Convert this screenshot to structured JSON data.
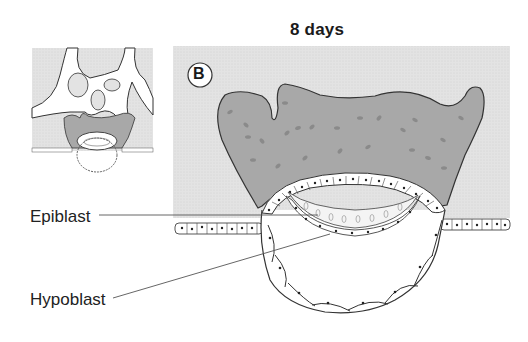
{
  "figure": {
    "title": "8 days",
    "panel_label": "B",
    "labels": [
      {
        "text": "Epiblast"
      },
      {
        "text": "Hypoblast"
      }
    ],
    "inset": {
      "description": "Small overview inset of implantation site with lacunar network"
    },
    "colors": {
      "endometrium": "#e2e2e2",
      "syncytiotrophoblast": "#a9a9a9",
      "outline": "#333333",
      "cells": "#ffffff"
    }
  }
}
